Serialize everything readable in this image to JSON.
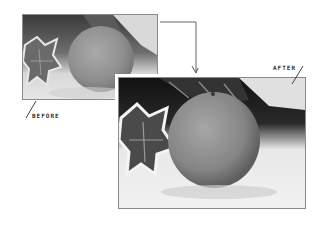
{
  "diagram": {
    "before": {
      "label": "BEFORE"
    },
    "after": {
      "label": "AFTER"
    },
    "connector": {
      "from": "before",
      "to": "after",
      "icon": "arrow-down-icon"
    }
  },
  "colors": {
    "frame_border": "#8a8a8a",
    "connector": "#666666",
    "label_text": "#333333"
  }
}
